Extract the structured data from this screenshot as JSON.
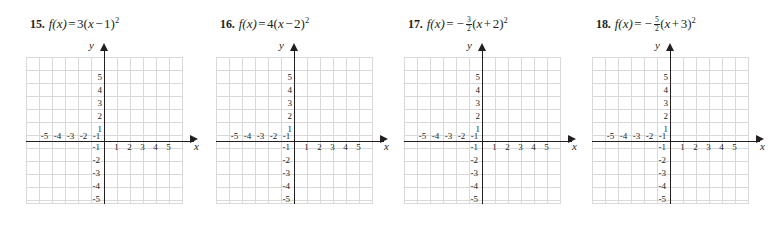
{
  "page": {
    "background": "#ffffff",
    "ink": "#231f20",
    "grid_color": "#d9d9d9"
  },
  "axes": {
    "x_label": "x",
    "y_label": "y",
    "x_ticks_negative": [
      "-5",
      "-4",
      "-3",
      "-2",
      "-1"
    ],
    "x_ticks_positive": [
      "1",
      "2",
      "3",
      "4",
      "5"
    ],
    "y_ticks_positive": [
      "5",
      "4",
      "3",
      "2",
      "1"
    ],
    "y_ticks_negative": [
      "-1",
      "-2",
      "-3",
      "-4",
      "-5"
    ],
    "x_range": [
      -6,
      6
    ],
    "y_range": [
      -6,
      6
    ],
    "grid": true
  },
  "problems": [
    {
      "number": "15.",
      "fn": "f(x)",
      "equals": "=",
      "coefficient": "3",
      "open_paren": "(",
      "variable": "x",
      "sign": "−",
      "constant": "1",
      "close_paren": ")",
      "exponent": "2",
      "expression": "f(x) = 3(x − 1)²"
    },
    {
      "number": "16.",
      "fn": "f(x)",
      "equals": "=",
      "coefficient": "4",
      "open_paren": "(",
      "variable": "x",
      "sign": "−",
      "constant": "2",
      "close_paren": ")",
      "exponent": "2",
      "expression": "f(x) = 4(x − 2)²"
    },
    {
      "number": "17.",
      "fn": "f(x)",
      "equals": "=",
      "leading_minus": "−",
      "frac_num": "3",
      "frac_den": "2",
      "open_paren": "(",
      "variable": "x",
      "sign": "+",
      "constant": "2",
      "close_paren": ")",
      "exponent": "2",
      "expression": "f(x) = −3/2(x + 2)²"
    },
    {
      "number": "18.",
      "fn": "f(x)",
      "equals": "=",
      "leading_minus": "−",
      "frac_num": "5",
      "frac_den": "2",
      "open_paren": "(",
      "variable": "x",
      "sign": "+",
      "constant": "3",
      "close_paren": ")",
      "exponent": "2",
      "expression": "f(x) = −5/2(x + 3)²"
    }
  ]
}
